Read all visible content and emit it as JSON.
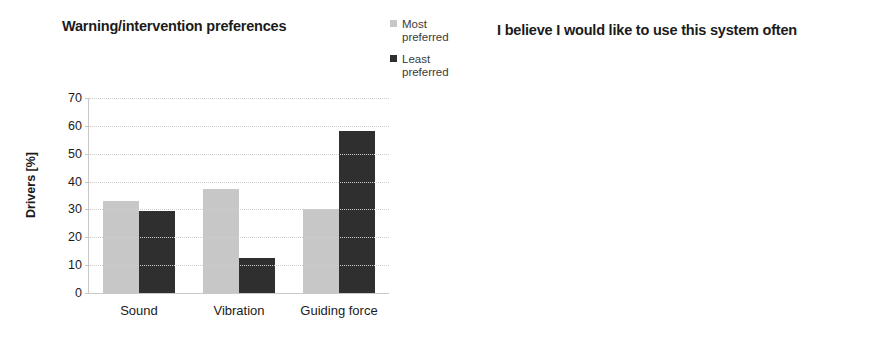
{
  "figure": {
    "panels": [
      "warning-intervention-preferences",
      "system-use-often"
    ]
  },
  "chart_data": [
    {
      "type": "bar",
      "title": "Warning/intervention preferences",
      "xlabel": "",
      "ylabel": "Drivers [%]",
      "ylim": [
        0,
        70
      ],
      "ytick_step": 10,
      "yticks": [
        "70",
        "60",
        "50",
        "40",
        "30",
        "20",
        "10",
        "0"
      ],
      "grid": true,
      "legend_position": "top-right",
      "categories": [
        "Sound",
        "Vibration",
        "Guiding force"
      ],
      "series": [
        {
          "name": "Most preferred",
          "legend_label": "Most\npreferred",
          "color": "#c7c7c7",
          "values": [
            33,
            37.5,
            30
          ]
        },
        {
          "name": "Least preferred",
          "legend_label": "Least\npreferred",
          "color": "#2f2f2f",
          "values": [
            29.5,
            12.5,
            58
          ]
        }
      ]
    },
    {
      "type": "bar",
      "title": "I believe I would like to use this system often",
      "xlabel": "",
      "ylabel": "Drivers [%]",
      "ylim": [
        0,
        100
      ],
      "ytick_step": 10,
      "yticks": [
        "100",
        "90",
        "80",
        "70",
        "60",
        "50",
        "40",
        "30",
        "20",
        "10",
        "0"
      ],
      "grid": true,
      "legend_position": "top-right",
      "categories": [
        "Yes",
        "No",
        "Don't know"
      ],
      "series": [
        {
          "name": "Sound",
          "legend_label": "Sound",
          "color": "#8c8c8c",
          "values": [
            79,
            16,
            4
          ]
        },
        {
          "name": "Vibration",
          "legend_label": "Vibration",
          "color": "#2b2b2b",
          "values": [
            83,
            8,
            8
          ]
        },
        {
          "name": "Guiding force",
          "legend_label": "Guiding force",
          "color": "#c4c4c4",
          "values": [
            50,
            41,
            8
          ]
        }
      ]
    }
  ]
}
